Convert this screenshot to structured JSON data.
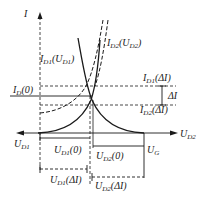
{
  "diagram": {
    "axis_labels": {
      "y": "I",
      "x_left": "U",
      "x_left_sub": "D1",
      "x_right": "U",
      "x_right_sub": "D2"
    },
    "curve_labels": {
      "id1": {
        "main": "I",
        "sub": "D1",
        "arg": "(U",
        "arg_sub": "D1",
        "close": ")"
      },
      "id2": {
        "main": "I",
        "sub": "D2",
        "arg": "(U",
        "arg_sub": "D2",
        "close": ")"
      }
    },
    "level_labels": {
      "id0": {
        "main": "I",
        "sub": "D",
        "arg": "(0)"
      },
      "id1_delta": {
        "main": "I",
        "sub": "D1",
        "arg": "(ΔI)"
      },
      "id2_delta": {
        "main": "I",
        "sub": "D2",
        "arg": "(ΔI)"
      },
      "delta_i": "ΔI"
    },
    "dimension_labels": {
      "ud1_0": {
        "main": "U",
        "sub": "D1",
        "arg": "(0)"
      },
      "ud2_0": {
        "main": "U",
        "sub": "D2",
        "arg": "(0)"
      },
      "ud1_delta": {
        "main": "U",
        "sub": "D1",
        "arg": "(ΔI)"
      },
      "ud2_delta": {
        "main": "U",
        "sub": "D2",
        "arg": "(ΔI)"
      },
      "ug": {
        "main": "U",
        "sub": "G"
      }
    },
    "colors": {
      "ink": "#1a1a1a",
      "background": "#ffffff"
    }
  }
}
